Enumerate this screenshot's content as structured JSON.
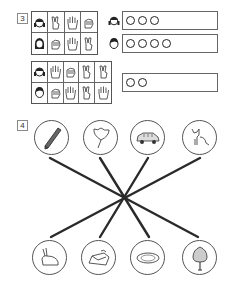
{
  "exercise3": {
    "number": "3",
    "grid_top": {
      "rows": [
        {
          "player": "girl-pigtails",
          "hands": [
            "victory-2",
            "open-hand-5",
            "fist-0"
          ]
        },
        {
          "player": "girl-long-hair",
          "hands": [
            "fist-0",
            "open-hand-5",
            "victory-2"
          ]
        }
      ]
    },
    "grid_bottom": {
      "rows": [
        {
          "player": "girl-pigtails",
          "hands": [
            "open-hand-5",
            "fist-0",
            "victory-2",
            "victory-2"
          ]
        },
        {
          "player": "boy",
          "hands": [
            "fist-0",
            "open-hand-5",
            "victory-2",
            "open-hand-5"
          ]
        }
      ]
    },
    "answers": [
      {
        "player": "girl-pigtails",
        "circles": 3
      },
      {
        "player": "boy",
        "circles": 4
      },
      {
        "player": "",
        "circles": 2
      }
    ]
  },
  "exercise4": {
    "number": "4",
    "top_pictures": [
      "pencil",
      "ginkgo-leaf",
      "car",
      "cat"
    ],
    "bottom_pictures": [
      "rabbit",
      "bed",
      "plate",
      "tree"
    ],
    "matches": [
      {
        "from": "pencil",
        "to": "tree"
      },
      {
        "from": "ginkgo-leaf",
        "to": "plate"
      },
      {
        "from": "car",
        "to": "bed"
      },
      {
        "from": "cat",
        "to": "rabbit"
      }
    ]
  }
}
